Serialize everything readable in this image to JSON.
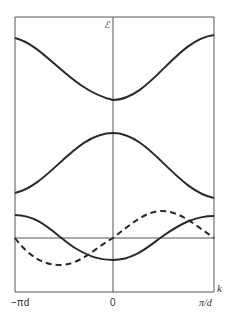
{
  "figure": {
    "type": "band-structure-diagram",
    "y_axis_label": "ℰ",
    "x_axis_label": "k",
    "x_ticks": [
      {
        "label": "−πd",
        "position": "left"
      },
      {
        "label": "0",
        "position": "center"
      },
      {
        "label": "π/d",
        "position": "right"
      }
    ],
    "colors": {
      "line": "#2a2a2a",
      "axis": "#555555",
      "frame": "#555555"
    }
  },
  "curves": [
    {
      "name": "upper-band",
      "style": "solid",
      "description": "cosine-like band, minimum at k=0"
    },
    {
      "name": "middle-band",
      "style": "solid",
      "description": "cosine-like band, maximum at k=0"
    },
    {
      "name": "lower-band",
      "style": "solid",
      "description": "band with minimum near k=0"
    },
    {
      "name": "dashed-curve",
      "style": "dashed",
      "description": "sine-like curve through zero at k=0"
    }
  ],
  "reference_line": {
    "name": "horizontal-reference-line",
    "style": "solid"
  }
}
